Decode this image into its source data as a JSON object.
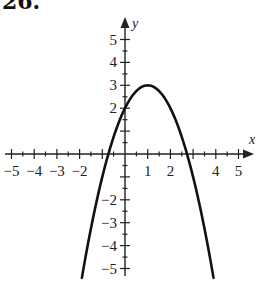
{
  "problem": {
    "label": "26."
  },
  "chart_data": {
    "type": "line",
    "title": "",
    "xlabel": "x",
    "ylabel": "y",
    "xlim": [
      -5.3,
      5.6
    ],
    "ylim": [
      -5.3,
      5.9
    ],
    "grid": false,
    "x_ticks": [
      -5,
      -4,
      -3,
      -2,
      -1,
      0,
      1,
      2,
      3,
      4,
      5
    ],
    "x_tick_labels": [
      "-5",
      "-4",
      "-3",
      "-2",
      "1",
      "2",
      "4",
      "5"
    ],
    "y_ticks": [
      -5,
      -4,
      -3,
      -2,
      -1,
      0,
      1,
      2,
      3,
      4,
      5
    ],
    "y_tick_labels": [
      "5",
      "4",
      "3",
      "2",
      "-2",
      "-3",
      "-4",
      "-5"
    ],
    "series": [
      {
        "name": "y = -x^2 + 2x + 2",
        "equation": "y = -(x - 1)^2 + 3",
        "vertex": [
          1,
          3
        ],
        "y_intercept": 2,
        "x_intercepts": [
          -0.73,
          2.73
        ],
        "x": [
          -1.9,
          -1.5,
          -1,
          -0.5,
          0,
          0.5,
          1,
          1.5,
          2,
          2.5,
          3,
          3.5,
          3.9
        ],
        "y": [
          -5.41,
          -3.25,
          -1,
          0.75,
          2,
          2.75,
          3,
          2.75,
          2,
          0.75,
          -1,
          -3.25,
          -5.41
        ]
      }
    ]
  },
  "labels": {
    "x_neg5": "−5",
    "x_neg4": "−4",
    "x_neg3": "−3",
    "x_neg2": "−2",
    "x_1": "1",
    "x_2": "2",
    "x_4": "4",
    "x_5": "5",
    "y_5": "5",
    "y_4": "4",
    "y_3": "3",
    "y_2": "2",
    "y_neg2": "−2",
    "y_neg3": "−3",
    "y_neg4": "−4",
    "y_neg5": "−5",
    "x_axis": "x",
    "y_axis": "y"
  }
}
